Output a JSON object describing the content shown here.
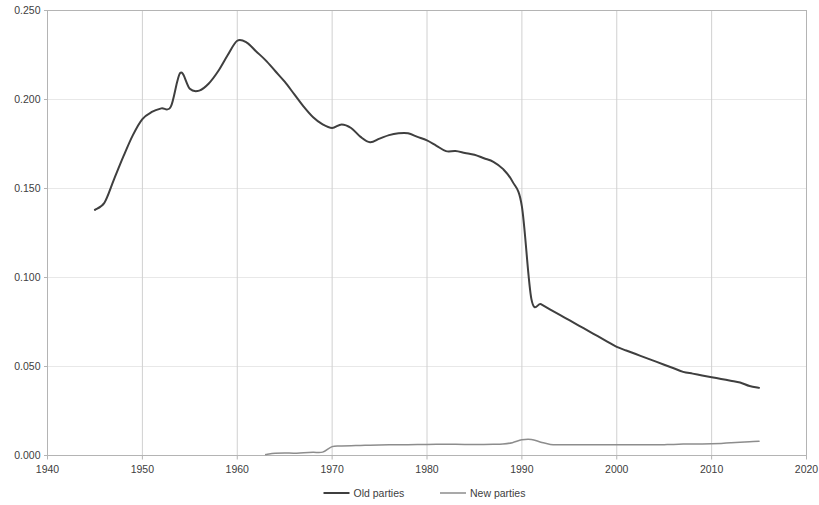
{
  "chart_data": {
    "type": "line",
    "title": "",
    "subtitle": "",
    "xlabel": "",
    "ylabel": "",
    "xlim": [
      1940,
      2020
    ],
    "ylim": [
      0.0,
      0.25
    ],
    "grid": true,
    "legend_position": "bottom",
    "x_ticks": [
      "1940",
      "1950",
      "1960",
      "1970",
      "1980",
      "1990",
      "2000",
      "2010",
      "2020"
    ],
    "x_tick_values": [
      1940,
      1950,
      1960,
      1970,
      1980,
      1990,
      2000,
      2010,
      2020
    ],
    "y_ticks": [
      "0.000",
      "0.050",
      "0.100",
      "0.150",
      "0.200",
      "0.250"
    ],
    "y_tick_values": [
      0.0,
      0.05,
      0.1,
      0.15,
      0.2,
      0.25
    ],
    "series": [
      {
        "name": "Old parties",
        "color": "#3f3f3f",
        "width": 2.0,
        "x": [
          1945,
          1946,
          1947,
          1948,
          1949,
          1950,
          1951,
          1952,
          1953,
          1954,
          1955,
          1956,
          1957,
          1958,
          1959,
          1960,
          1961,
          1962,
          1963,
          1964,
          1965,
          1966,
          1967,
          1968,
          1969,
          1970,
          1971,
          1972,
          1973,
          1974,
          1975,
          1976,
          1977,
          1978,
          1979,
          1980,
          1981,
          1982,
          1983,
          1984,
          1985,
          1986,
          1987,
          1988,
          1989,
          1990,
          1991,
          1992,
          1993,
          1994,
          1995,
          1996,
          1997,
          1998,
          1999,
          2000,
          2001,
          2002,
          2003,
          2004,
          2005,
          2006,
          2007,
          2008,
          2009,
          2010,
          2011,
          2012,
          2013,
          2014,
          2015
        ],
        "values": [
          0.138,
          0.142,
          0.155,
          0.168,
          0.18,
          0.189,
          0.193,
          0.195,
          0.196,
          0.215,
          0.206,
          0.205,
          0.209,
          0.216,
          0.225,
          0.233,
          0.232,
          0.227,
          0.222,
          0.216,
          0.21,
          0.203,
          0.196,
          0.19,
          0.186,
          0.184,
          0.186,
          0.184,
          0.179,
          0.176,
          0.178,
          0.18,
          0.181,
          0.181,
          0.179,
          0.177,
          0.174,
          0.171,
          0.171,
          0.17,
          0.169,
          0.167,
          0.165,
          0.161,
          0.154,
          0.14,
          0.088,
          0.085,
          0.082,
          0.079,
          0.076,
          0.073,
          0.07,
          0.067,
          0.064,
          0.061,
          0.059,
          0.057,
          0.055,
          0.053,
          0.051,
          0.049,
          0.047,
          0.046,
          0.045,
          0.044,
          0.043,
          0.042,
          0.041,
          0.039,
          0.038
        ]
      },
      {
        "name": "New parties",
        "color": "#8d8d8d",
        "width": 1.5,
        "x": [
          1963,
          1964,
          1965,
          1966,
          1967,
          1968,
          1969,
          1970,
          1971,
          1972,
          1973,
          1974,
          1975,
          1976,
          1977,
          1978,
          1979,
          1980,
          1981,
          1982,
          1983,
          1984,
          1985,
          1986,
          1987,
          1988,
          1989,
          1990,
          1991,
          1992,
          1993,
          1994,
          1995,
          1996,
          1997,
          1998,
          1999,
          2000,
          2001,
          2002,
          2003,
          2004,
          2005,
          2006,
          2007,
          2008,
          2009,
          2010,
          2011,
          2012,
          2013,
          2014,
          2015
        ],
        "values": [
          0.0005,
          0.0012,
          0.0014,
          0.0013,
          0.0016,
          0.0018,
          0.0019,
          0.005,
          0.0053,
          0.0055,
          0.0056,
          0.0058,
          0.0059,
          0.006,
          0.006,
          0.0061,
          0.0062,
          0.0062,
          0.0063,
          0.0063,
          0.0063,
          0.0062,
          0.0062,
          0.0062,
          0.0063,
          0.0065,
          0.0072,
          0.0088,
          0.009,
          0.0075,
          0.0062,
          0.006,
          0.006,
          0.006,
          0.006,
          0.006,
          0.006,
          0.006,
          0.006,
          0.006,
          0.006,
          0.006,
          0.0061,
          0.0062,
          0.0064,
          0.0065,
          0.0065,
          0.0066,
          0.0068,
          0.0071,
          0.0074,
          0.0077,
          0.008
        ]
      }
    ]
  },
  "legend": {
    "items": [
      {
        "label": "Old parties"
      },
      {
        "label": "New parties"
      }
    ]
  },
  "colors": {
    "old_parties": "#3f3f3f",
    "new_parties": "#8d8d8d",
    "gridline": "#d0d0d0",
    "axis": "#b4b4b4",
    "tick_text": "#404040",
    "background": "#ffffff"
  }
}
